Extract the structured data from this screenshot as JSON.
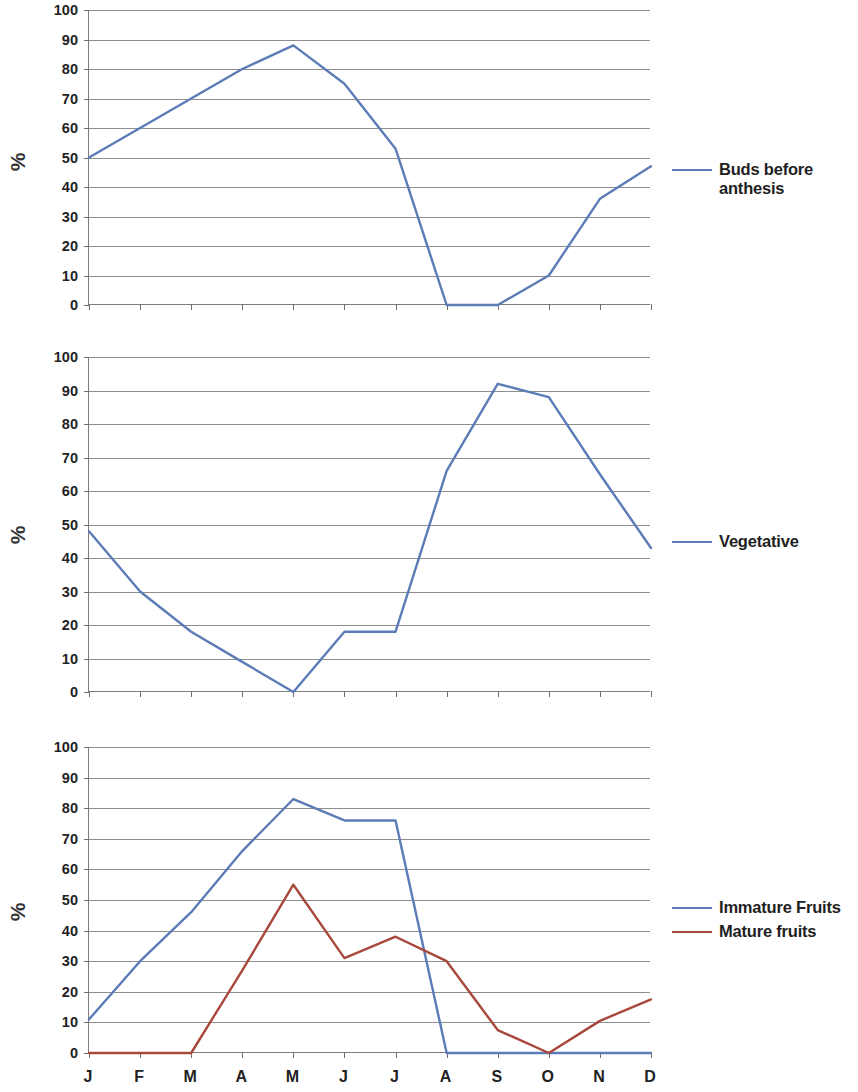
{
  "axis_title": "%",
  "months": [
    "J",
    "F",
    "M",
    "A",
    "M",
    "J",
    "J",
    "A",
    "S",
    "O",
    "N",
    "D"
  ],
  "y_ticks": [
    "0",
    "10",
    "20",
    "30",
    "40",
    "50",
    "60",
    "70",
    "80",
    "90",
    "100"
  ],
  "colors": {
    "blue": "#5b7cb6",
    "red": "#a8483b",
    "grid": "#8e8e8e",
    "axis": "#7d7d7d",
    "text": "#222222"
  },
  "panels": [
    {
      "id": "buds-before-anthesis",
      "legend": [
        {
          "label": "Buds before anthesis",
          "color": "#5b7cb6",
          "wrap": true
        }
      ]
    },
    {
      "id": "vegetative",
      "legend": [
        {
          "label": "Vegetative",
          "color": "#5b7cb6",
          "wrap": false
        }
      ]
    },
    {
      "id": "fruits",
      "legend": [
        {
          "label": "Immature Fruits",
          "color": "#5b7cb6",
          "wrap": false
        },
        {
          "label": "Mature fruits",
          "color": "#a8483b",
          "wrap": false
        }
      ]
    }
  ],
  "chart_data": [
    {
      "type": "line",
      "title": "Buds before anthesis",
      "xlabel": "",
      "ylabel": "%",
      "categories": [
        "J",
        "F",
        "M",
        "A",
        "M",
        "J",
        "J",
        "A",
        "S",
        "O",
        "N",
        "D"
      ],
      "ylim": [
        0,
        100
      ],
      "xlim_labels_shown": false,
      "grid": true,
      "legend_position": "right",
      "series": [
        {
          "name": "Buds before anthesis",
          "color": "#5b7cb6",
          "values": [
            50,
            60,
            70,
            80,
            88,
            75,
            53,
            0,
            0,
            10,
            36,
            47
          ]
        }
      ]
    },
    {
      "type": "line",
      "title": "Vegetative",
      "xlabel": "",
      "ylabel": "%",
      "categories": [
        "J",
        "F",
        "M",
        "A",
        "M",
        "J",
        "J",
        "A",
        "S",
        "O",
        "N",
        "D"
      ],
      "ylim": [
        0,
        100
      ],
      "xlim_labels_shown": false,
      "grid": true,
      "legend_position": "right",
      "series": [
        {
          "name": "Vegetative",
          "color": "#5b7cb6",
          "values": [
            48,
            30,
            18,
            9,
            0,
            18,
            18,
            66,
            92,
            88,
            65,
            43
          ]
        }
      ]
    },
    {
      "type": "line",
      "title": "Fruits",
      "xlabel": "",
      "ylabel": "%",
      "categories": [
        "J",
        "F",
        "M",
        "A",
        "M",
        "J",
        "J",
        "A",
        "S",
        "O",
        "N",
        "D"
      ],
      "ylim": [
        0,
        100
      ],
      "xlim_labels_shown": true,
      "grid": true,
      "legend_position": "right",
      "series": [
        {
          "name": "Immature Fruits",
          "color": "#5b7cb6",
          "values": [
            11,
            30,
            46,
            66,
            83,
            76,
            76,
            0,
            0,
            0,
            0,
            0
          ]
        },
        {
          "name": "Mature fruits",
          "color": "#a8483b",
          "values": [
            0,
            0,
            0,
            27,
            55,
            31,
            38,
            30,
            7.5,
            0,
            10.5,
            17.5
          ]
        }
      ]
    }
  ]
}
